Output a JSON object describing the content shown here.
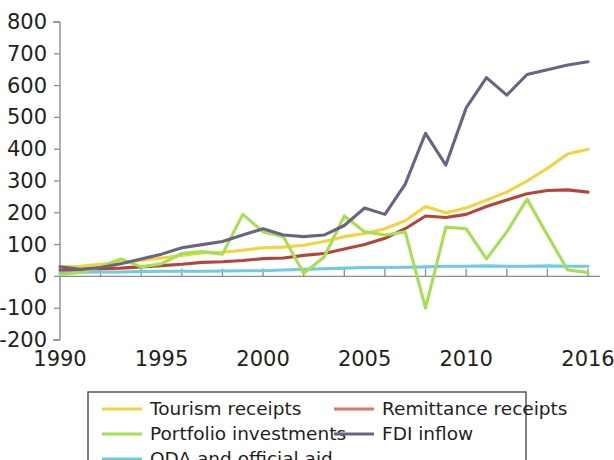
{
  "chart_data": {
    "type": "line",
    "title": "",
    "subtitle": "",
    "xlabel": "",
    "ylabel": "",
    "xlim": [
      1990,
      2016
    ],
    "ylim": [
      -200,
      800
    ],
    "yticks": [
      800,
      700,
      600,
      500,
      400,
      300,
      200,
      100,
      0,
      -100,
      -200
    ],
    "ytick_labels": [
      "800",
      "700",
      "600",
      "500",
      "400",
      "300",
      "200",
      "100",
      "0",
      "-100",
      "-200"
    ],
    "xticks": [
      1990,
      1995,
      2000,
      2005,
      2010,
      2016
    ],
    "xtick_labels": [
      "1990",
      "1995",
      "2000",
      "2005",
      "2010",
      "2016"
    ],
    "x_minor_tick_step": 2,
    "grid": false,
    "legend_position": "bottom",
    "legend_columns": 2,
    "x": [
      1990,
      1991,
      1992,
      1993,
      1994,
      1995,
      1996,
      1997,
      1998,
      1999,
      2000,
      2001,
      2002,
      2003,
      2004,
      2005,
      2006,
      2007,
      2008,
      2009,
      2010,
      2011,
      2012,
      2013,
      2014,
      2015,
      2016
    ],
    "series": [
      {
        "name": "Tourism receipts",
        "color": "#f5d33c",
        "values": [
          30,
          32,
          38,
          44,
          50,
          58,
          66,
          74,
          76,
          82,
          90,
          92,
          98,
          110,
          125,
          135,
          150,
          175,
          220,
          200,
          215,
          240,
          265,
          300,
          340,
          385,
          400
        ]
      },
      {
        "name": "Remittance receipts",
        "color": "#b5453a",
        "values": [
          20,
          22,
          24,
          26,
          30,
          34,
          38,
          44,
          46,
          50,
          56,
          58,
          66,
          72,
          86,
          100,
          120,
          150,
          190,
          185,
          195,
          220,
          240,
          260,
          270,
          272,
          265
        ]
      },
      {
        "name": "Portfolio investments",
        "color": "#a5e051",
        "values": [
          5,
          12,
          30,
          55,
          30,
          40,
          72,
          78,
          70,
          195,
          140,
          125,
          10,
          60,
          190,
          140,
          130,
          140,
          -100,
          155,
          150,
          55,
          140,
          243,
          130,
          20,
          12
        ]
      },
      {
        "name": "FDI inflow",
        "color": "#6a6384",
        "values": [
          30,
          22,
          28,
          40,
          55,
          70,
          90,
          100,
          110,
          130,
          150,
          130,
          125,
          130,
          160,
          215,
          195,
          290,
          450,
          350,
          530,
          625,
          570,
          635,
          650,
          665,
          675
        ]
      },
      {
        "name": "ODA and official aid",
        "color": "#6fcbe0",
        "values": [
          12,
          13,
          14,
          14,
          15,
          16,
          16,
          16,
          17,
          18,
          18,
          20,
          22,
          24,
          26,
          28,
          28,
          29,
          30,
          32,
          32,
          33,
          32,
          32,
          33,
          32,
          32
        ]
      }
    ]
  },
  "legend": {
    "entries": [
      {
        "label": "Tourism receipts",
        "color": "#f5d33c"
      },
      {
        "label": "Remittance receipts",
        "color": "#dd7668"
      },
      {
        "label": "Portfolio investments",
        "color": "#a5e051"
      },
      {
        "label": "FDI inflow",
        "color": "#6a6384"
      },
      {
        "label": "ODA and official aid",
        "color": "#6fcbe0"
      }
    ]
  }
}
